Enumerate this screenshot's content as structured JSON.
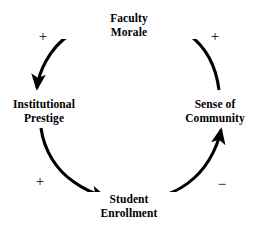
{
  "diagram": {
    "type": "causal-loop",
    "background_color": "#ffffff",
    "stroke_color": "#000000",
    "nodes": [
      {
        "id": "faculty-morale",
        "line1": "Faculty",
        "line2": "Morale",
        "position": "top"
      },
      {
        "id": "institutional-prestige",
        "line1": "Institutional",
        "line2": "Prestige",
        "position": "left"
      },
      {
        "id": "sense-of-community",
        "line1": "Sense of",
        "line2": "Community",
        "position": "right"
      },
      {
        "id": "student-enrollment",
        "line1": "Student",
        "line2": "Enrollment",
        "position": "bottom"
      }
    ],
    "links": [
      {
        "id": "faculty-morale-to-institutional-prestige",
        "from": "faculty-morale",
        "to": "institutional-prestige",
        "polarity": "+",
        "polarity_position": "top-left"
      },
      {
        "id": "institutional-prestige-to-student-enrollment",
        "from": "institutional-prestige",
        "to": "student-enrollment",
        "polarity": "+",
        "polarity_position": "bottom-left"
      },
      {
        "id": "student-enrollment-to-sense-of-community",
        "from": "student-enrollment",
        "to": "sense-of-community",
        "polarity": "−",
        "polarity_position": "bottom-right"
      },
      {
        "id": "sense-of-community-to-faculty-morale",
        "from": "sense-of-community",
        "to": "faculty-morale",
        "polarity": "+",
        "polarity_position": "top-right"
      }
    ],
    "polarity_labels": {
      "top_left": "+",
      "top_right": "+",
      "bottom_left": "+",
      "bottom_right": "−"
    }
  }
}
